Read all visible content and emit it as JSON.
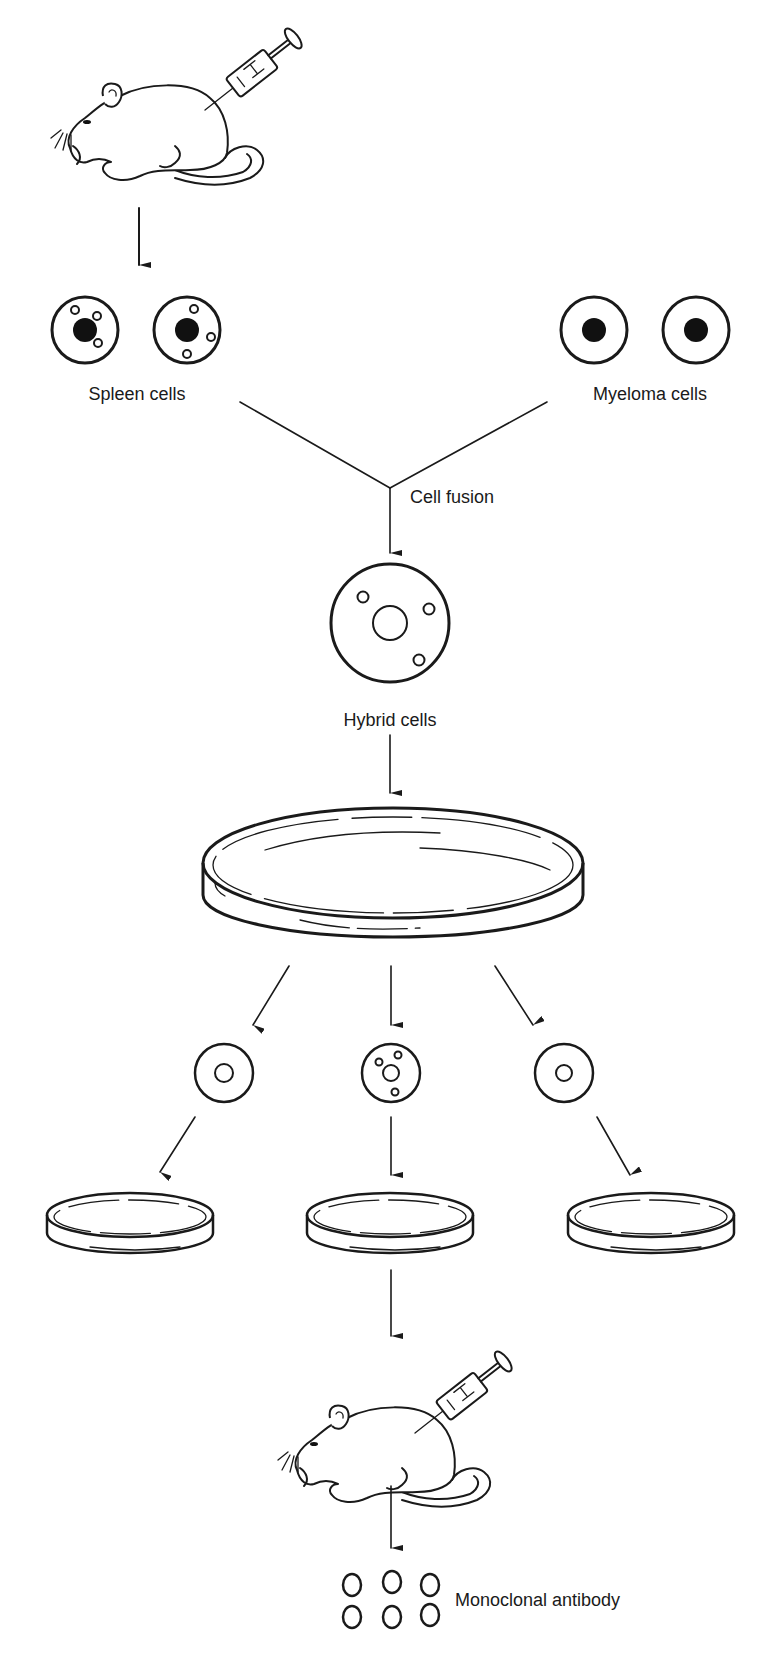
{
  "diagram": {
    "labels": {
      "spleen_cells": "Spleen cells",
      "myeloma_cells": "Myeloma cells",
      "cell_fusion": "Cell fusion",
      "hybrid_cells": "Hybrid cells",
      "monoclonal_antibody": "Monoclonal antibody"
    },
    "steps": [
      {
        "id": "immunized-mouse",
        "description": "Mouse injected with antigen via syringe"
      },
      {
        "id": "spleen-cells",
        "label": "Spleen cells",
        "count": 2
      },
      {
        "id": "myeloma-cells",
        "label": "Myeloma cells",
        "count": 2
      },
      {
        "id": "cell-fusion",
        "label": "Cell fusion"
      },
      {
        "id": "hybrid-cells",
        "label": "Hybrid cells"
      },
      {
        "id": "culture-dish",
        "description": "Large petri dish"
      },
      {
        "id": "clones",
        "count": 3
      },
      {
        "id": "clone-dishes",
        "count": 3
      },
      {
        "id": "injected-mouse",
        "description": "Mouse injected with selected clone"
      },
      {
        "id": "antibodies",
        "label": "Monoclonal antibody",
        "count": 6
      }
    ],
    "colors": {
      "line": "#1a1a1a",
      "background": "#ffffff"
    }
  }
}
